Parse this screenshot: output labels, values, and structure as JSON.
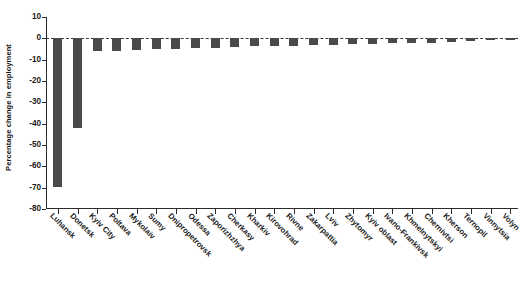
{
  "chart_data": {
    "type": "bar",
    "title": "",
    "xlabel": "",
    "ylabel": "Percentage change in employment",
    "ylim": [
      -80,
      10
    ],
    "ytick_labels": [
      "10",
      "0",
      "-10",
      "-20",
      "-30",
      "-40",
      "-50",
      "-60",
      "-70",
      "-80"
    ],
    "yticks": [
      10,
      0,
      -10,
      -20,
      -30,
      -40,
      -50,
      -60,
      -70,
      -80
    ],
    "grid": false,
    "legend": null,
    "bar_color": "#4a4a4a",
    "zero_line": 0,
    "categories": [
      "Luhansk",
      "Donetsk",
      "Kyiv City",
      "Poltava",
      "Mykolaiv",
      "Sumy",
      "Dnipropetrovsk",
      "Odessa",
      "Zaporizhzhya",
      "Cherkasy",
      "Kharkiv",
      "Kirovohrad",
      "Rivne",
      "Zakarpattia",
      "Lviv",
      "Zhytomyr",
      "Kyiv oblast",
      "Ivano-Frankivsk",
      "Khmelnytskyi",
      "Chernivtsi",
      "Kherson",
      "Ternopil",
      "Vinnytsia",
      "Volyn"
    ],
    "values": [
      -69.5,
      -42.0,
      -6.0,
      -5.8,
      -5.5,
      -5.0,
      -4.8,
      -4.5,
      -4.3,
      -4.0,
      -3.8,
      -3.6,
      -3.4,
      -3.2,
      -3.0,
      -2.8,
      -2.6,
      -2.4,
      -2.2,
      -2.0,
      -1.6,
      -1.3,
      -1.0,
      -0.6
    ]
  }
}
